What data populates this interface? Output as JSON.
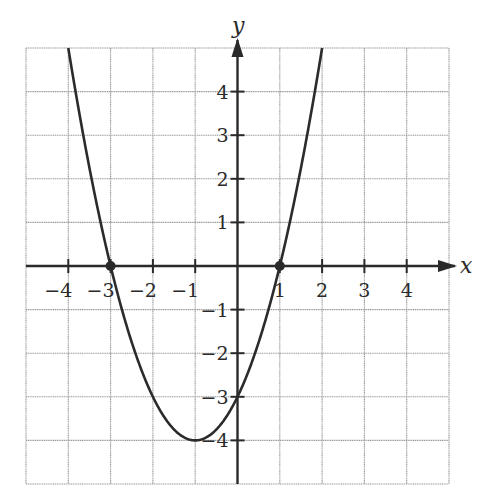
{
  "chart_data": {
    "type": "line",
    "title": "",
    "xlabel": "x",
    "ylabel": "y",
    "xlim": [
      -5,
      5
    ],
    "ylim": [
      -5,
      5
    ],
    "grid": true,
    "legend": null,
    "x_ticks": [
      -4,
      -3,
      -2,
      -1,
      1,
      2,
      3,
      4
    ],
    "y_ticks": [
      -4,
      -3,
      -2,
      -1,
      1,
      2,
      3,
      4
    ],
    "x_tick_labels": [
      "−4",
      "−3",
      "−2",
      "−1",
      "1",
      "2",
      "3",
      "4"
    ],
    "y_tick_labels": [
      "−4",
      "−3",
      "−2",
      "−1",
      "1",
      "2",
      "3",
      "4"
    ],
    "series": [
      {
        "name": "parabola",
        "equation": "y = x^2 + 2x - 3",
        "coefficients": {
          "a": 1,
          "b": 2,
          "c": -3
        },
        "x": [
          -4.0,
          -3.5,
          -3.0,
          -2.5,
          -2.0,
          -1.5,
          -1.0,
          -0.5,
          0.0,
          0.5,
          1.0,
          1.5,
          2.0
        ],
        "y": [
          5.0,
          1.25,
          0.0,
          -1.75,
          -3.0,
          -3.75,
          -4.0,
          -3.75,
          -3.0,
          -1.75,
          0.0,
          2.25,
          5.0
        ],
        "color": "#2b2b2b"
      }
    ],
    "marked_points": [
      {
        "x": -3,
        "y": 0,
        "label": "x-intercept"
      },
      {
        "x": 1,
        "y": 0,
        "label": "x-intercept"
      }
    ],
    "annotations": {
      "vertex": {
        "x": -1,
        "y": -4
      },
      "y_intercept": {
        "x": 0,
        "y": -3
      }
    }
  },
  "colors": {
    "grid": "#9a9a9a",
    "axis": "#2a2a2a",
    "curve": "#2b2b2b",
    "background": "#ffffff"
  }
}
